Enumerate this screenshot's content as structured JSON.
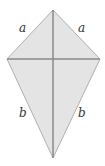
{
  "diagram": {
    "type": "kite",
    "fill_color": "#e4e4e4",
    "stroke_color": "#9a9a9a",
    "diagonal_color": "#8a8a8a",
    "labels": {
      "upper_left": "a",
      "upper_right": "a",
      "lower_left": "b",
      "lower_right": "b"
    }
  }
}
